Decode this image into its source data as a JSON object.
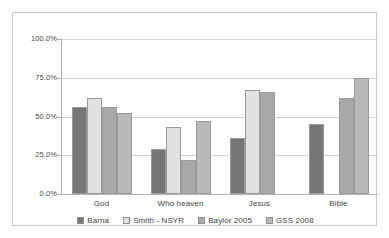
{
  "chart_data": {
    "type": "bar",
    "title": "",
    "subtitle": "",
    "xlabel": "",
    "ylabel": "",
    "ylim": [
      0,
      100
    ],
    "y_ticks": [
      "0.0%",
      "25.0%",
      "50.0%",
      "75.0%",
      "100.0%"
    ],
    "y_tick_values": [
      0,
      25,
      50,
      75,
      100
    ],
    "grid": true,
    "legend_position": "bottom",
    "categories": [
      "God",
      "Who heaven",
      "Jesus",
      "Bible"
    ],
    "series": [
      {
        "name": "Barna",
        "color": "#767676",
        "values": [
          56,
          29,
          36,
          45
        ]
      },
      {
        "name": "Smith - NSYR",
        "color": "#e2e2e2",
        "values": [
          62,
          43,
          67,
          null
        ]
      },
      {
        "name": "Baylor 2005",
        "color": "#a8a8a8",
        "values": [
          56,
          22,
          66,
          62
        ]
      },
      {
        "name": "GSS 2008",
        "color": "#b9b9b9",
        "values": [
          52,
          47,
          null,
          75
        ]
      }
    ]
  }
}
